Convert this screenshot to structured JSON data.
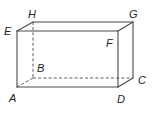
{
  "diagram": {
    "type": "rectangular-prism",
    "colors": {
      "edge": "#4a4a4a",
      "label": "#222222",
      "background": "#ffffff"
    },
    "vertices": {
      "A": {
        "label": "A",
        "x": 17,
        "y": 87,
        "label_x": 9,
        "label_y": 102
      },
      "B": {
        "label": "B",
        "x": 33,
        "y": 78,
        "label_x": 37,
        "label_y": 72
      },
      "C": {
        "label": "C",
        "x": 133,
        "y": 78,
        "label_x": 138,
        "label_y": 84
      },
      "D": {
        "label": "D",
        "x": 118,
        "y": 87,
        "label_x": 117,
        "label_y": 103
      },
      "E": {
        "label": "E",
        "x": 17,
        "y": 31,
        "label_x": 4,
        "label_y": 35
      },
      "F": {
        "label": "F",
        "x": 118,
        "y": 31,
        "label_x": 106,
        "label_y": 47
      },
      "G": {
        "label": "G",
        "x": 133,
        "y": 22,
        "label_x": 129,
        "label_y": 18
      },
      "H": {
        "label": "H",
        "x": 33,
        "y": 22,
        "label_x": 28,
        "label_y": 18
      }
    },
    "visible_edges": [
      [
        "E",
        "F"
      ],
      [
        "F",
        "D"
      ],
      [
        "D",
        "A"
      ],
      [
        "A",
        "E"
      ],
      [
        "E",
        "H"
      ],
      [
        "H",
        "G"
      ],
      [
        "G",
        "F"
      ],
      [
        "G",
        "C"
      ],
      [
        "C",
        "D"
      ]
    ],
    "hidden_edges": [
      [
        "H",
        "B"
      ],
      [
        "B",
        "A"
      ],
      [
        "B",
        "C"
      ]
    ]
  }
}
